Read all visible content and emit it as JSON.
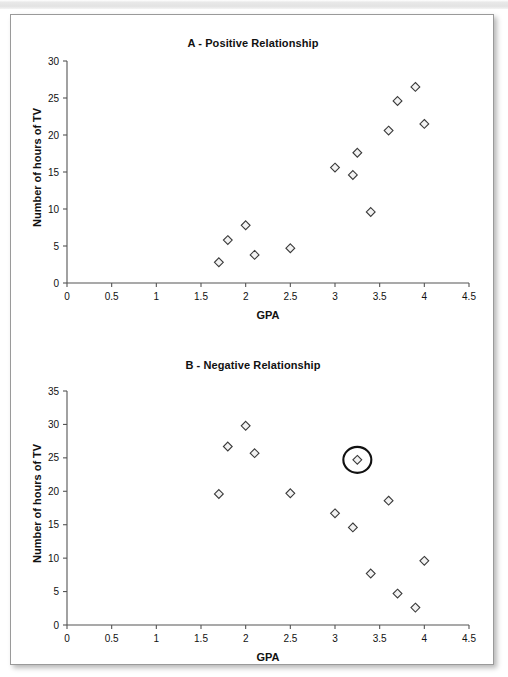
{
  "page": {
    "background_color": "#ffffff",
    "card_border_color": "#9a9a9a"
  },
  "charts": [
    {
      "id": "chart-a",
      "title": "A - Positive Relationship",
      "xlabel": "GPA",
      "ylabel": "Number of hours of TV"
    },
    {
      "id": "chart-b",
      "title": "B - Negative Relationship",
      "xlabel": "GPA",
      "ylabel": "Number of hours of TV"
    }
  ],
  "chart_data": [
    {
      "type": "scatter",
      "title": "A - Positive Relationship",
      "xlabel": "GPA",
      "ylabel": "Number of hours of TV",
      "xlim": [
        0,
        4.5
      ],
      "ylim": [
        0,
        30
      ],
      "xticks": [
        0,
        0.5,
        1,
        1.5,
        2,
        2.5,
        3,
        3.5,
        4,
        4.5
      ],
      "xticklabels": [
        "0",
        "0.5",
        "1",
        "1.5",
        "2",
        "2.5",
        "3",
        "3.5",
        "4",
        "4.5"
      ],
      "yticks": [
        0,
        5,
        10,
        15,
        20,
        25,
        30
      ],
      "yticklabels": [
        "0",
        "5",
        "10",
        "15",
        "20",
        "25",
        "30"
      ],
      "grid": false,
      "legend": false,
      "marker": "diamond",
      "marker_fill": "#f2f2f2",
      "marker_edge": "#3a3a3a",
      "points": [
        {
          "x": 1.7,
          "y": 2.8
        },
        {
          "x": 1.8,
          "y": 5.8
        },
        {
          "x": 2.0,
          "y": 7.8
        },
        {
          "x": 2.1,
          "y": 3.8
        },
        {
          "x": 2.5,
          "y": 4.7
        },
        {
          "x": 3.0,
          "y": 15.6
        },
        {
          "x": 3.2,
          "y": 14.6
        },
        {
          "x": 3.25,
          "y": 17.6
        },
        {
          "x": 3.4,
          "y": 9.6
        },
        {
          "x": 3.6,
          "y": 20.6
        },
        {
          "x": 3.7,
          "y": 24.6
        },
        {
          "x": 3.9,
          "y": 26.5
        },
        {
          "x": 4.0,
          "y": 21.5
        }
      ],
      "annotations": []
    },
    {
      "type": "scatter",
      "title": "B - Negative Relationship",
      "xlabel": "GPA",
      "ylabel": "Number of hours of TV",
      "xlim": [
        0,
        4.5
      ],
      "ylim": [
        0,
        35
      ],
      "xticks": [
        0,
        0.5,
        1,
        1.5,
        2,
        2.5,
        3,
        3.5,
        4,
        4.5
      ],
      "xticklabels": [
        "0",
        "0.5",
        "1",
        "1.5",
        "2",
        "2.5",
        "3",
        "3.5",
        "4",
        "4.5"
      ],
      "yticks": [
        0,
        5,
        10,
        15,
        20,
        25,
        30,
        35
      ],
      "yticklabels": [
        "0",
        "5",
        "10",
        "15",
        "20",
        "25",
        "30",
        "35"
      ],
      "grid": false,
      "legend": false,
      "marker": "diamond",
      "marker_fill": "#f2f2f2",
      "marker_edge": "#3a3a3a",
      "points": [
        {
          "x": 1.7,
          "y": 19.6
        },
        {
          "x": 1.8,
          "y": 26.7
        },
        {
          "x": 2.0,
          "y": 29.8
        },
        {
          "x": 2.1,
          "y": 25.7
        },
        {
          "x": 2.5,
          "y": 19.7
        },
        {
          "x": 3.0,
          "y": 16.7
        },
        {
          "x": 3.2,
          "y": 14.6
        },
        {
          "x": 3.25,
          "y": 24.7,
          "highlighted": true
        },
        {
          "x": 3.4,
          "y": 7.7
        },
        {
          "x": 3.6,
          "y": 18.6
        },
        {
          "x": 3.7,
          "y": 4.7
        },
        {
          "x": 3.9,
          "y": 2.6
        },
        {
          "x": 4.0,
          "y": 9.6
        }
      ],
      "annotations": [
        {
          "kind": "circle-highlight",
          "x": 3.25,
          "y": 24.7,
          "radius_px": 13
        }
      ]
    }
  ]
}
